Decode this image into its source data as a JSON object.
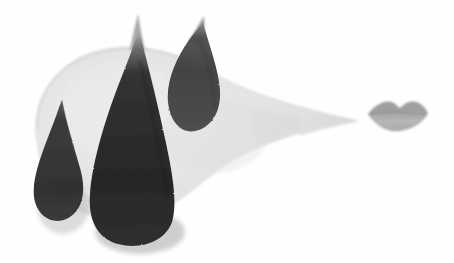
{
  "artwork": {
    "title": "Abstract Ink and Watercolor Composition",
    "medium": "watercolor and ink wash on paper",
    "background_color": "#ffffff",
    "canvas": {
      "width": 454,
      "height": 263
    },
    "palette": {
      "background": "#ffffff",
      "pale_gray": "#e4e4e4",
      "light_gray": "#d8d8d8",
      "mid_gray": "#a8a8a8",
      "shadow_gray": "#8d8d8d",
      "dark_ink": "#2e2e2e",
      "deep_ink": "#232323",
      "tip_gray": "#9a9a9a"
    },
    "elements": [
      {
        "name": "pale-gray-body",
        "label": "Pale gray tapering body",
        "description": "Large rounded mass at left tapering to a sharp point at right",
        "color": "#e4e4e4"
      },
      {
        "name": "teardrop-left",
        "label": "Small left teardrop",
        "description": "Narrow dark teardrop with pointed top and rounded base",
        "color": "#2e2e2e"
      },
      {
        "name": "teardrop-center",
        "label": "Large central teardrop",
        "description": "Largest dark teardrop with tall pointed spike",
        "color": "#232323"
      },
      {
        "name": "teardrop-right",
        "label": "Small upper-right teardrop",
        "description": "Rounded dark teardrop with curved leaning tip",
        "color": "#3a3a3a"
      },
      {
        "name": "lips-shape",
        "label": "Gray lips",
        "description": "Pair of lips rendered in soft gray at far right",
        "color": "#a8a8a8"
      }
    ]
  }
}
